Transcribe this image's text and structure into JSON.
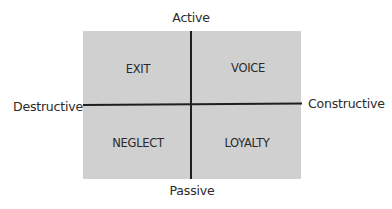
{
  "diagram": {
    "type": "2x2 quadrant matrix",
    "axes": {
      "top": "Active",
      "bottom": "Passive",
      "left": "Destructive",
      "right": "Constructive"
    },
    "quadrants": {
      "top_left": "EXIT",
      "top_right": "VOICE",
      "bottom_left": "NEGLECT",
      "bottom_right": "LOYALTY"
    },
    "colors": {
      "box_fill": "#d0d0d0",
      "axis_lines": "#1f1f1f",
      "text": "#2a2a2a",
      "background": "#ffffff"
    }
  }
}
